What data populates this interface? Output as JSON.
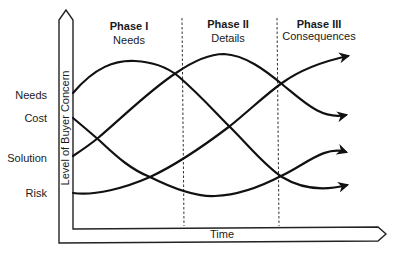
{
  "diagram": {
    "type": "concept-curves",
    "axes": {
      "y_label": "Level of Buyer Concern",
      "x_label": "Time"
    },
    "phases": [
      {
        "title": "Phase I",
        "subtitle": "Needs"
      },
      {
        "title": "Phase II",
        "subtitle": "Details"
      },
      {
        "title": "Phase III",
        "subtitle": "Consequences"
      }
    ],
    "levels": [
      {
        "label": "Needs"
      },
      {
        "label": "Cost"
      },
      {
        "label": "Solution"
      },
      {
        "label": "Risk"
      }
    ],
    "curves": [
      {
        "name": "Needs",
        "trend": "rises to peak in Phase I, falls through Phase II, ends low"
      },
      {
        "name": "Cost",
        "trend": "falls through Phase I, minimum in Phase II, rises in Phase III"
      },
      {
        "name": "Solution",
        "trend": "rises through Phase I, peaks in Phase II, falls in Phase III"
      },
      {
        "name": "Risk",
        "trend": "low in Phase I, rises steadily, ends highest"
      }
    ],
    "colors": {
      "line": "#111111",
      "background": "#ffffff"
    }
  }
}
